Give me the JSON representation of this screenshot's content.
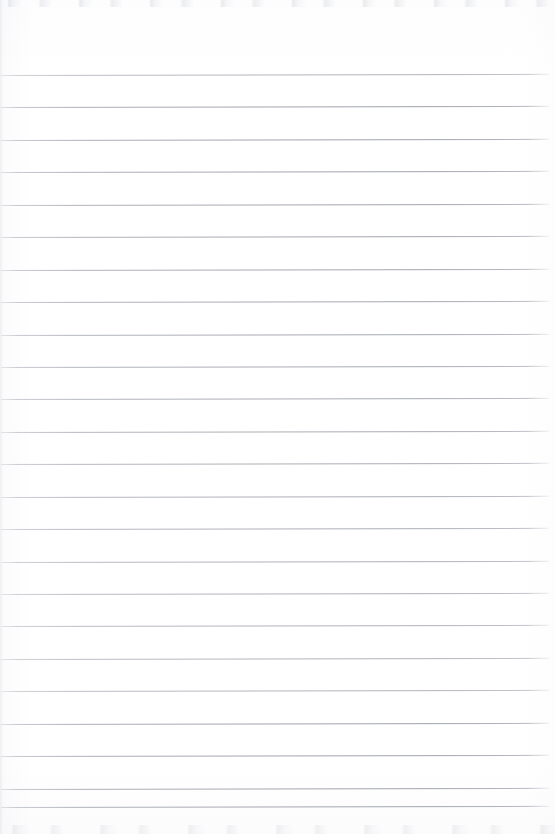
{
  "document": {
    "type": "lined-paper-scan",
    "title": "Blank ruled notebook page",
    "description": "Scanned sheet of blank lined paper with no handwriting or printed text",
    "width_px": 555,
    "height_px": 834,
    "background_color": "#fefefe",
    "has_text_content": false,
    "text_content": ""
  },
  "ruling": {
    "style": "horizontal-ruled",
    "line_color": "#a0a4ac",
    "line_thickness_px": 1,
    "line_count": 23,
    "line_spacing_px": 32.4,
    "first_line_y_px": 75,
    "last_line_y_px": 807,
    "line_start_x_px": 1,
    "line_end_x_px": 549,
    "tilt_deg": -0.12,
    "top_margin_px": 75,
    "bottom_margin_px": 27,
    "left_margin_rule": false,
    "right_margin_rule": false,
    "line_y_positions": [
      75,
      107.4,
      139.9,
      172.3,
      204.7,
      237.2,
      269.6,
      302,
      334.5,
      366.9,
      399.3,
      431.8,
      464.2,
      496.6,
      529.1,
      561.5,
      593.9,
      626.4,
      658.8,
      691.2,
      723.7,
      756.1,
      788.5,
      807
    ]
  },
  "edges": {
    "top_noise_band_height_px": 7,
    "bottom_noise_band_height_px": 9,
    "left_shadow_width_px": 5,
    "noise_color": "#c4c7cc"
  }
}
